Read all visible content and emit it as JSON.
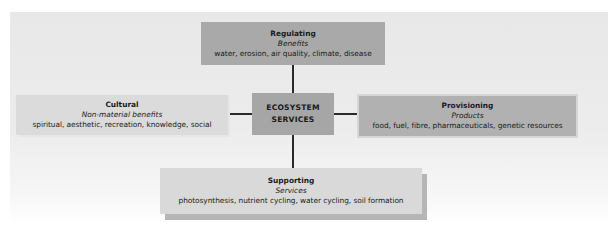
{
  "diagram": {
    "center": {
      "line1": "ECOSYSTEM",
      "line2": "SERVICES"
    },
    "nodes": {
      "regulating": {
        "title": "Regulating",
        "subtitle": "Benefits",
        "details": "water, erosion, air quality, climate, disease"
      },
      "cultural": {
        "title": "Cultural",
        "subtitle": "Non-material benefits",
        "details": "spiritual, aesthetic, recreation, knowledge, social"
      },
      "provisioning": {
        "title": "Provisioning",
        "subtitle": "Products",
        "details": "food, fuel, fibre, pharmaceuticals, genetic resources"
      },
      "supporting": {
        "title": "Supporting",
        "subtitle": "Services",
        "details": "photosynthesis, nutrient cycling, water cycling, soil formation"
      }
    },
    "colors": {
      "regulating": "#a9a9a9",
      "center": "#a6a6a6",
      "cultural": "#dbdbdb",
      "provisioning": "#b1b1b1",
      "supporting": "#d9d9d9",
      "connector": "#2a2a2a"
    }
  }
}
